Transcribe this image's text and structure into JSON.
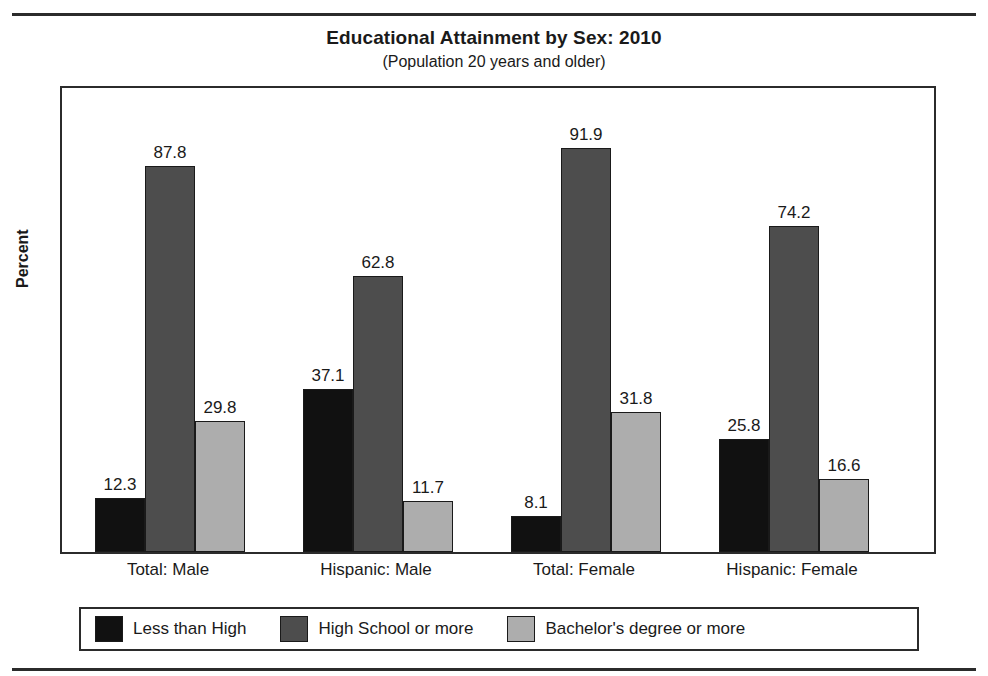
{
  "chart_data": {
    "type": "bar",
    "title": "Educational Attainment by Sex: 2010",
    "subtitle": "(Population 20 years and older)",
    "xlabel": "",
    "ylabel": "Percent",
    "ylim": [
      0,
      100
    ],
    "grid": false,
    "legend_position": "bottom",
    "categories": [
      "Total: Male",
      "Hispanic: Male",
      "Total: Female",
      "Hispanic: Female"
    ],
    "series": [
      {
        "name": "Less than High",
        "color": "#111111",
        "values": [
          12.3,
          37.1,
          8.1,
          25.8
        ]
      },
      {
        "name": "High School or more",
        "color": "#4d4d4d",
        "values": [
          87.8,
          62.8,
          91.9,
          74.2
        ]
      },
      {
        "name": "Bachelor's degree or more",
        "color": "#adadad",
        "values": [
          29.8,
          11.7,
          31.8,
          16.6
        ]
      }
    ],
    "value_labels": [
      [
        "12.3",
        "87.8",
        "29.8"
      ],
      [
        "37.1",
        "62.8",
        "11.7"
      ],
      [
        "8.1",
        "91.9",
        "31.8"
      ],
      [
        "25.8",
        "74.2",
        "16.6"
      ]
    ]
  },
  "legend": {
    "items": [
      {
        "label": "Less than High"
      },
      {
        "label": "High School or more"
      },
      {
        "label": "Bachelor's degree or more"
      }
    ]
  }
}
